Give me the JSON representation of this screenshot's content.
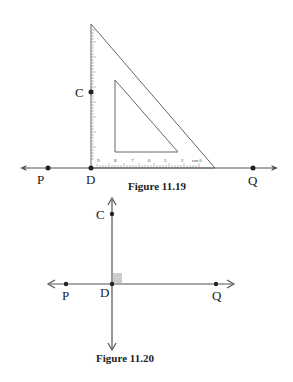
{
  "figures": [
    {
      "caption": "Figure 11.19",
      "points": {
        "P": "P",
        "D": "D",
        "Q": "Q",
        "C": "C"
      },
      "ruler_labels": [
        "9",
        "8",
        "7",
        "6",
        "5",
        "4",
        "3",
        "2",
        "1",
        "cm 0"
      ]
    },
    {
      "caption": "Figure 11.20",
      "points": {
        "P": "P",
        "D": "D",
        "Q": "Q",
        "C": "C"
      }
    }
  ],
  "colors": {
    "line": "#555555",
    "point": "#222222",
    "right_angle": "#cccccc"
  }
}
